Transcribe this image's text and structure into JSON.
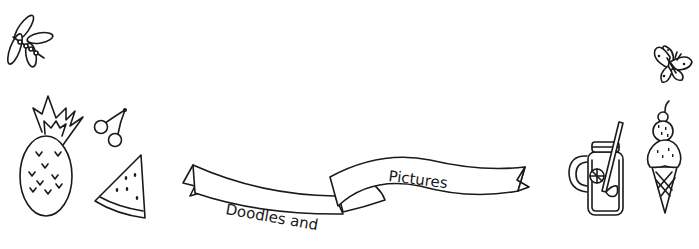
{
  "scene": {
    "background": "#ffffff",
    "line_color": "#1a1a1a",
    "banner": {
      "left_text": "Doodles and",
      "right_text": "Pictures"
    },
    "doodles": [
      {
        "name": "dragonfly"
      },
      {
        "name": "pineapple"
      },
      {
        "name": "cherries"
      },
      {
        "name": "watermelon-slice"
      },
      {
        "name": "lemonade-jar"
      },
      {
        "name": "butterfly"
      },
      {
        "name": "ice-cream-cone"
      }
    ]
  }
}
